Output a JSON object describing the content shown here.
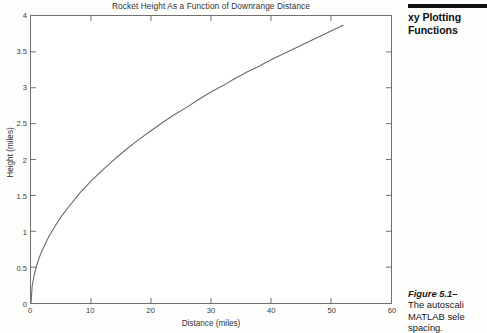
{
  "page": {
    "running_head_lines": [
      "xy Plotting",
      "Functions"
    ],
    "caption": {
      "lead": "Figure 5.1–",
      "lines": [
        "The autoscali",
        "MATLAB sele",
        "spacing."
      ]
    },
    "rule_color": "#111111"
  },
  "chart_data": {
    "type": "line",
    "title": "Rocket Height As a Function of Downrange Distance",
    "xlabel": "Distance (miles)",
    "ylabel": "Height (miles)",
    "xlim": [
      0,
      60
    ],
    "ylim": [
      0,
      4
    ],
    "xticks": [
      0,
      10,
      20,
      30,
      40,
      50,
      60
    ],
    "xticklabels": [
      "0",
      "10",
      "20",
      "30",
      "40",
      "50",
      "60"
    ],
    "yticks": [
      0,
      0.5,
      1,
      1.5,
      2,
      2.5,
      3,
      3.5,
      4
    ],
    "yticklabels": [
      "0",
      "0.5",
      "1",
      "1.5",
      "2",
      "2.5",
      "3",
      "3.5",
      "4"
    ],
    "grid": false,
    "legend": null,
    "line_color": "#6a6a6a",
    "series": [
      {
        "name": "Rocket height",
        "x": [
          0,
          0.2,
          0.5,
          1,
          1.5,
          2,
          3,
          4,
          5,
          6,
          8,
          10,
          12,
          14,
          16,
          18,
          20,
          22,
          24,
          26,
          28,
          30,
          32,
          34,
          36,
          38,
          40,
          42,
          44,
          46,
          48,
          50,
          52
        ],
        "y": [
          0,
          0.24,
          0.38,
          0.54,
          0.66,
          0.76,
          0.93,
          1.07,
          1.2,
          1.31,
          1.52,
          1.7,
          1.86,
          2.01,
          2.15,
          2.28,
          2.4,
          2.52,
          2.63,
          2.73,
          2.84,
          2.94,
          3.03,
          3.13,
          3.22,
          3.3,
          3.39,
          3.47,
          3.55,
          3.63,
          3.71,
          3.79,
          3.87
        ]
      }
    ]
  }
}
